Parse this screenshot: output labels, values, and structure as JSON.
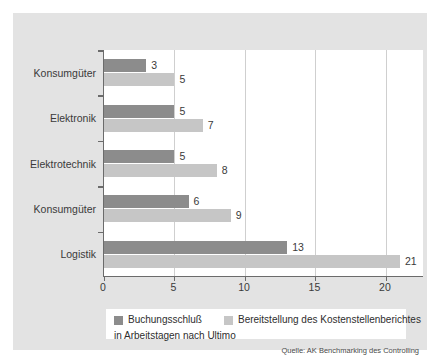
{
  "chart_data": {
    "type": "bar",
    "orientation": "horizontal",
    "title": "",
    "xlabel": "",
    "ylabel": "",
    "xlim": [
      0,
      22.7
    ],
    "xticks": [
      0,
      5,
      10,
      15,
      20
    ],
    "xtick_labels": [
      "0",
      "5",
      "10",
      "15",
      "20"
    ],
    "grid": true,
    "grid_axis": "x",
    "legend_position": "bottom",
    "categories": [
      "Konsumgüter",
      "Elektronik",
      "Elektrotechnik",
      "Konsumgüter",
      "Logistik"
    ],
    "series": [
      {
        "name": "Buchungsschluß",
        "color": "#8c8c8c",
        "values": [
          3,
          5,
          5,
          6,
          13
        ],
        "labels": [
          "3",
          "5",
          "5",
          "6",
          "13"
        ]
      },
      {
        "name": "Bereitstellung des Kostenstellenberichtes",
        "color": "#c6c6c6",
        "values": [
          5,
          7,
          8,
          9,
          21
        ],
        "labels": [
          "5",
          "7",
          "8",
          "9",
          "21"
        ]
      }
    ],
    "legend_subtitle": "in Arbeitstagen nach Ultimo",
    "source_note": "Quelle: AK Benchmarking des Controlling"
  },
  "legend": {
    "entries": [
      {
        "label": "Buchungsschluß"
      },
      {
        "label": "Bereitstellung des Kostenstellenberichtes"
      }
    ],
    "subtitle": "in Arbeitstagen nach Ultimo"
  },
  "source": {
    "text": "Quelle: AK Benchmarking des Controlling"
  },
  "colors": {
    "series_dark": "#8c8c8c",
    "series_light": "#c6c6c6",
    "panel_background": "#e3e3e3",
    "plot_background": "#ffffff",
    "axis": "#6b6b6b",
    "gridline": "#cfcfcf",
    "text": "#3a3a3a"
  }
}
